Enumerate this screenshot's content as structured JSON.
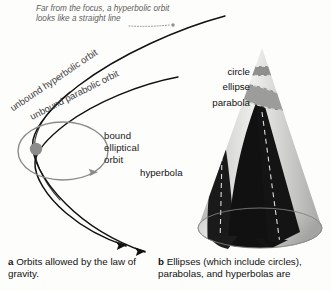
{
  "figure": {
    "background_color": "#fdfdfc",
    "panels": [
      "a",
      "b"
    ]
  },
  "panel_a": {
    "annotation": {
      "line1": "Far from the focus, a hyperbolic orbit",
      "line2": "looks like a straight line",
      "style": "italic",
      "color": "#5d5d5d"
    },
    "curve_labels": [
      {
        "text": "unbound hyperbolic orbit",
        "rotation_deg": -34
      },
      {
        "text": "unbound parabolic orbit",
        "rotation_deg": -27
      }
    ],
    "orbit_label": {
      "line1": "bound",
      "line2": "elliptical",
      "line3": "orbit"
    },
    "focus": {
      "name": "focus-body",
      "color": "#8c8c8c"
    },
    "ellipse_color": "#8a8a8a",
    "trajectory_color": "#111111"
  },
  "panel_b": {
    "cone_labels": [
      {
        "text": "circle"
      },
      {
        "text": "ellipse"
      },
      {
        "text": "parabola"
      },
      {
        "text": "hyperbola"
      }
    ],
    "cone": {
      "light_color": "#e4e4e2",
      "mid_color": "#bdbdbb",
      "dark_color": "#9a9a98",
      "section_color": "#111111",
      "dash_color": "#dcdcda"
    }
  },
  "captions": {
    "a": {
      "marker": "a",
      "text": "Orbits allowed by the law of gravity."
    },
    "b": {
      "marker": "b",
      "text": "Ellipses (which include circles), parabolas, and hyperbolas are"
    }
  }
}
